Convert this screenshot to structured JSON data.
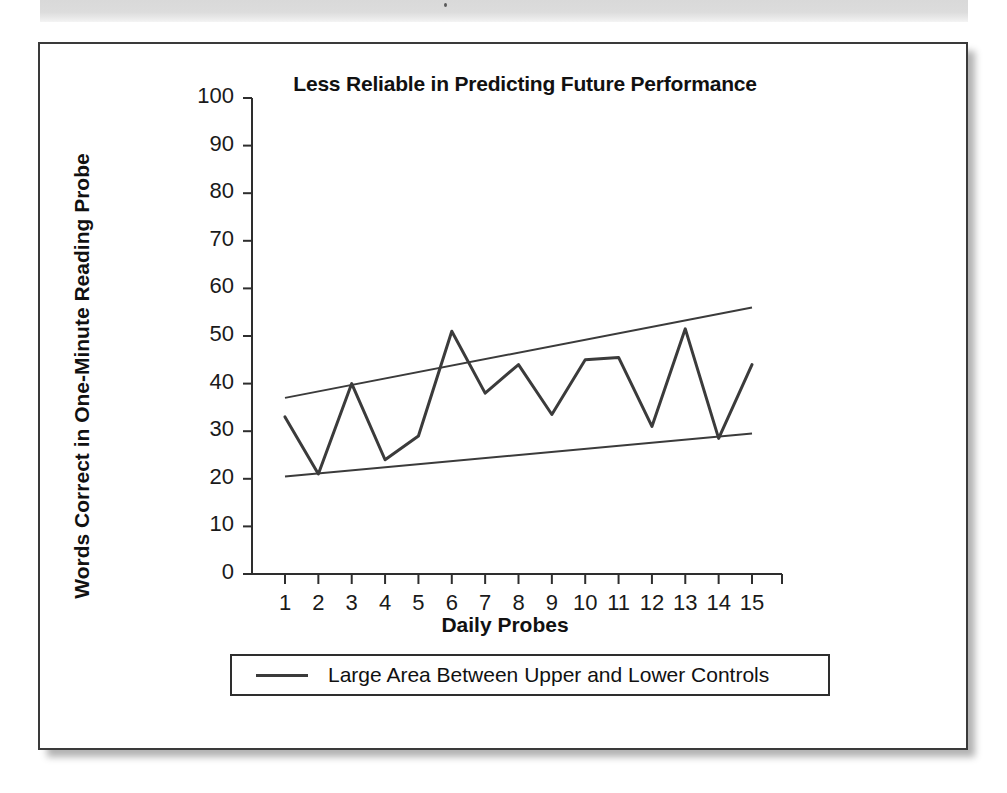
{
  "figure": {
    "title": "Less Reliable in Predicting Future Performance",
    "legend_label": "Large Area Between Upper and Lower Controls",
    "legend_swatch_name": "line-swatch"
  },
  "chart_data": {
    "type": "line",
    "title": "Less Reliable in Predicting Future Performance",
    "xlabel": "Daily Probes",
    "ylabel": "Words Correct in One-Minute Reading Probe",
    "xlim": [
      1,
      15
    ],
    "ylim": [
      0,
      100
    ],
    "ytick_step": 10,
    "grid": false,
    "legend_position": "below-axes",
    "x": [
      1,
      2,
      3,
      4,
      5,
      6,
      7,
      8,
      9,
      10,
      11,
      12,
      13,
      14,
      15
    ],
    "xtick_labels": [
      "1",
      "2",
      "3",
      "4",
      "5",
      "6",
      "7",
      "8",
      "9",
      "10",
      "11",
      "12",
      "13",
      "14",
      "15"
    ],
    "ytick_labels": [
      "0",
      "10",
      "20",
      "30",
      "40",
      "50",
      "60",
      "70",
      "80",
      "90",
      "100"
    ],
    "ytick_values": [
      0,
      10,
      20,
      30,
      40,
      50,
      60,
      70,
      80,
      90,
      100
    ],
    "series": [
      {
        "name": "Daily probe scores",
        "values": [
          33,
          21,
          40,
          24,
          29,
          51,
          38,
          44,
          33.5,
          45,
          45.5,
          31,
          51.5,
          28.5,
          44
        ]
      },
      {
        "name": "Upper control line",
        "values": [
          37,
          38.4,
          39.8,
          41.2,
          42.6,
          44,
          45.4,
          46.8,
          48.2,
          49.6,
          51,
          52.4,
          53.8,
          55.2,
          56
        ]
      },
      {
        "name": "Lower control line",
        "values": [
          20.5,
          21.1,
          21.8,
          22.4,
          23.1,
          23.7,
          24.4,
          25,
          25.7,
          26.3,
          27,
          27.6,
          28.3,
          28.9,
          29.5
        ]
      }
    ],
    "legend": [
      "Large Area Between Upper and Lower Controls"
    ],
    "colors": {
      "data_line": "#3b3b3b",
      "control_line": "#3b3b3b",
      "axis": "#2e2e2e",
      "text": "#111111",
      "background": "#ffffff"
    }
  }
}
